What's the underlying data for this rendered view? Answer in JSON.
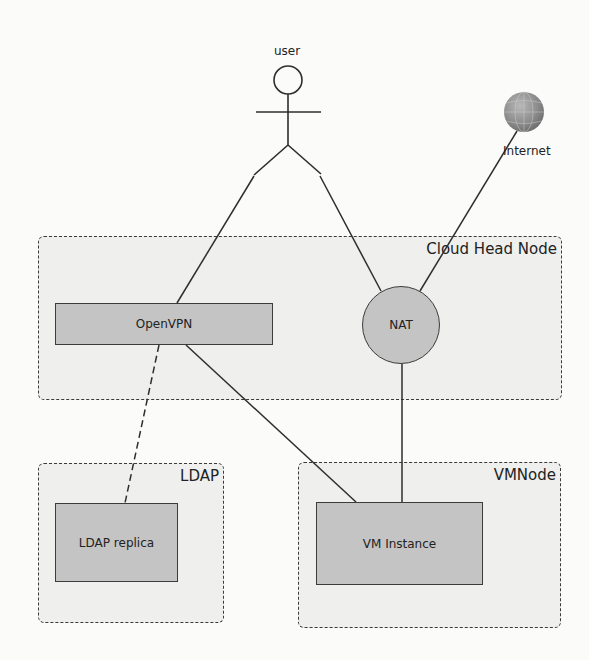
{
  "diagram": {
    "actors": {
      "user": {
        "label": "user"
      },
      "internet": {
        "label": "Internet",
        "icon": "globe-icon"
      }
    },
    "containers": [
      {
        "id": "cloud-head-node",
        "title": "Cloud Head Node"
      },
      {
        "id": "ldap",
        "title": "LDAP"
      },
      {
        "id": "vmnode",
        "title": "VMNode"
      }
    ],
    "nodes": {
      "openvpn": {
        "label": "OpenVPN",
        "shape": "rectangle"
      },
      "nat": {
        "label": "NAT",
        "shape": "circle"
      },
      "ldap_replica": {
        "label": "LDAP replica",
        "shape": "rectangle"
      },
      "vm_instance": {
        "label": "VM Instance",
        "shape": "rectangle"
      }
    },
    "edges": [
      {
        "from": "user",
        "to": "openvpn",
        "style": "solid"
      },
      {
        "from": "user",
        "to": "nat",
        "style": "solid"
      },
      {
        "from": "internet",
        "to": "nat",
        "style": "solid"
      },
      {
        "from": "openvpn",
        "to": "ldap_replica",
        "style": "dashed"
      },
      {
        "from": "openvpn",
        "to": "vm_instance",
        "style": "solid"
      },
      {
        "from": "nat",
        "to": "vm_instance",
        "style": "solid"
      }
    ],
    "colors": {
      "background": "#fbfbfa",
      "container_fill": "#efefee",
      "node_fill": "#c4c4c4",
      "stroke": "#3a3a3a"
    }
  }
}
